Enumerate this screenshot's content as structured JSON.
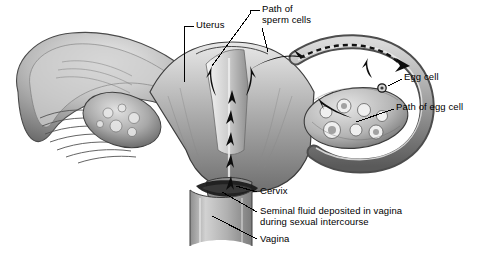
{
  "figure": {
    "background_color": "#ffffff",
    "ink_color": "#000000",
    "style": "grayscale pencil/airbrush medical illustration"
  },
  "labels": [
    {
      "id": "uterus",
      "text": "Uterus",
      "x": 196,
      "y": 22
    },
    {
      "id": "sperm_path",
      "text": "Path of\nsperm cells",
      "x": 262,
      "y": 6
    },
    {
      "id": "egg_cell",
      "text": "Egg cell",
      "x": 404,
      "y": 75
    },
    {
      "id": "egg_path",
      "text": "Path of egg cell",
      "x": 396,
      "y": 105
    },
    {
      "id": "cervix",
      "text": "Cervix",
      "x": 259,
      "y": 188
    },
    {
      "id": "seminal_fluid",
      "text": "Seminal fluid deposited in vagina\nduring sexual intercourse",
      "x": 259,
      "y": 207
    },
    {
      "id": "vagina",
      "text": "Vagina",
      "x": 259,
      "y": 235
    }
  ],
  "structures": [
    {
      "id": "left-fallopian-funnel",
      "name": "Left fallopian tube infundibulum with fimbriae"
    },
    {
      "id": "left-ovary",
      "name": "Left ovary"
    },
    {
      "id": "uterus-body",
      "name": "Uterus body with cavity"
    },
    {
      "id": "right-fallopian-tube",
      "name": "Right fallopian tube"
    },
    {
      "id": "right-ovary",
      "name": "Right ovary with follicles"
    },
    {
      "id": "cervix-structure",
      "name": "Cervix"
    },
    {
      "id": "vagina-canal",
      "name": "Vaginal canal"
    },
    {
      "id": "seminal-pool",
      "name": "Seminal fluid pool in posterior fornix"
    },
    {
      "id": "egg-cell-dot",
      "name": "Released egg cell"
    }
  ],
  "colors": {
    "tissue_light": "#d9d9d9",
    "tissue_mid": "#9a9a9a",
    "tissue_dark": "#575757",
    "tissue_darkest": "#2a2a2a",
    "cavity": "#f2f2f2",
    "arrow": "#111111"
  }
}
